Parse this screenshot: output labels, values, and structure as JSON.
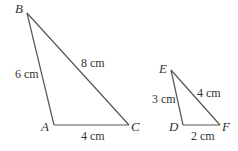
{
  "triangles": [
    {
      "name": "ABC",
      "vertices": {
        "A": {
          "label": "A",
          "x": 54,
          "y": 125
        },
        "B": {
          "label": "B",
          "x": 27,
          "y": 13
        },
        "C": {
          "label": "C",
          "x": 129,
          "y": 125
        }
      },
      "sides": {
        "AB": "6 cm",
        "BC": "8 cm",
        "AC": "4 cm"
      }
    },
    {
      "name": "DEF",
      "vertices": {
        "D": {
          "label": "D",
          "x": 183,
          "y": 125
        },
        "E": {
          "label": "E",
          "x": 171,
          "y": 70
        },
        "F": {
          "label": "F",
          "x": 220,
          "y": 125
        }
      },
      "sides": {
        "DE": "3 cm",
        "EF": "4 cm",
        "DF": "2 cm"
      }
    }
  ],
  "colors": {
    "edge": "#555555",
    "text": "#333333",
    "background": "#ffffff"
  }
}
